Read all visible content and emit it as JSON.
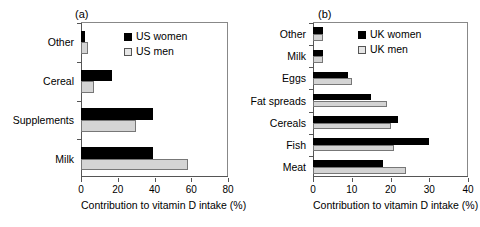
{
  "figure": {
    "panels": [
      {
        "tag": "(a)",
        "xlabel": "Contribution to vitamin D intake (%)",
        "legend": [
          "US women",
          "US men"
        ],
        "xticks": [
          "0",
          "20",
          "40",
          "60",
          "80"
        ],
        "categories": [
          "Milk",
          "Supplements",
          "Cereal",
          "Other"
        ]
      },
      {
        "tag": "(b)",
        "xlabel": "Contribution to vitamin D intake (%)",
        "legend": [
          "UK women",
          "UK men"
        ],
        "xticks": [
          "0",
          "10",
          "20",
          "30",
          "40"
        ],
        "categories": [
          "Meat",
          "Fish",
          "Cereals",
          "Fat spreads",
          "Eggs",
          "Milk",
          "Other"
        ]
      }
    ]
  },
  "chart_data": [
    {
      "type": "bar",
      "title": "(a)",
      "orientation": "horizontal",
      "categories": [
        "Milk",
        "Supplements",
        "Cereal",
        "Other"
      ],
      "series": [
        {
          "name": "US women",
          "color": "#000000",
          "values": [
            39,
            39,
            17,
            2
          ]
        },
        {
          "name": "US men",
          "color": "#d4d4d4",
          "values": [
            58,
            30,
            7,
            4
          ]
        }
      ],
      "xlabel": "Contribution to vitamin D intake (%)",
      "ylabel": "",
      "xlim": [
        0,
        80
      ],
      "xticks": [
        0,
        20,
        40,
        60,
        80
      ],
      "grid": false,
      "legend_position": "top-right"
    },
    {
      "type": "bar",
      "title": "(b)",
      "orientation": "horizontal",
      "categories": [
        "Meat",
        "Fish",
        "Cereals",
        "Fat spreads",
        "Eggs",
        "Milk",
        "Other"
      ],
      "series": [
        {
          "name": "UK women",
          "color": "#000000",
          "values": [
            18,
            30,
            22,
            15,
            9,
            2.5,
            2.5
          ]
        },
        {
          "name": "UK men",
          "color": "#d4d4d4",
          "values": [
            24,
            21,
            20,
            19,
            10,
            2.5,
            2.5
          ]
        }
      ],
      "xlabel": "Contribution to vitamin D intake (%)",
      "ylabel": "",
      "xlim": [
        0,
        40
      ],
      "xticks": [
        0,
        10,
        20,
        30,
        40
      ],
      "grid": false,
      "legend_position": "top-right"
    }
  ]
}
